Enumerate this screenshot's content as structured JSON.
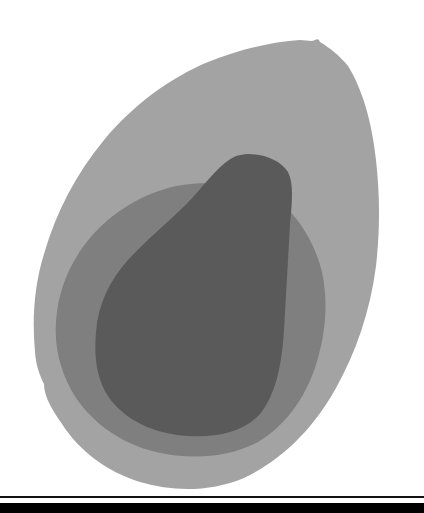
{
  "figure": {
    "regions": [
      {
        "name": "outer-region",
        "fill": "#a3a3a3",
        "path": "M 312 41 C 316 40 318 37 320 42 C 330 48 340 56 348 66 C 362 88 372 122 376 160 C 380 196 380 230 376 266 C 370 312 356 352 336 388 C 314 428 282 460 244 478 C 210 492 174 492 140 482 C 108 472 80 452 62 424 C 54 412 44 398 44 384 C 40 376 36 366 35 352 C 32 320 34 286 44 254 C 56 212 76 174 104 140 C 134 104 170 78 208 62 C 238 50 270 42 300 40 Z"
      },
      {
        "name": "middle-region",
        "fill": "#7f7f7f",
        "path": "M 210 183 C 232 180 254 184 272 196 C 296 212 314 240 322 272 C 328 300 326 330 318 358 C 308 394 288 424 258 442 C 228 458 190 460 156 452 C 122 444 94 424 76 398 C 62 376 54 350 56 322 C 58 290 70 262 90 238 C 112 212 142 194 176 186 C 188 184 198 183 210 183 Z"
      },
      {
        "name": "inner-region",
        "fill": "#5a5a5a",
        "path": "M 248 154 C 264 154 280 160 288 172 C 294 184 292 202 290 224 C 288 260 286 296 284 330 C 282 364 276 394 260 414 C 244 432 216 438 188 436 C 154 434 124 420 108 396 C 96 378 94 354 96 332 C 98 304 110 280 128 260 C 150 236 174 218 194 196 C 208 180 222 162 236 156 C 240 155 244 154 248 154 Z"
      }
    ]
  },
  "rules": {
    "thin": {
      "color": "#111111"
    },
    "thick": {
      "color": "#000000"
    }
  }
}
